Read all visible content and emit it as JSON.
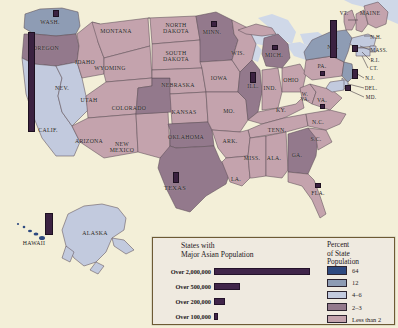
{
  "map": {
    "title": "Asian Population of the United States",
    "background_color": "#f3efd8",
    "water_color": "#cfd8e8",
    "bar_color": "#3b2241",
    "state_labels": [
      {
        "name": "WASH.",
        "text": "WASH.",
        "x": 50,
        "y": 22,
        "size": "sm"
      },
      {
        "name": "OREGON",
        "text": "OREGON",
        "x": 46,
        "y": 48,
        "size": "sm"
      },
      {
        "name": "CALIF.",
        "text": "CALIF.",
        "x": 48,
        "y": 130,
        "size": "sm"
      },
      {
        "name": "NEV.",
        "text": "NEV.",
        "x": 62,
        "y": 88,
        "size": "sm"
      },
      {
        "name": "IDAHO",
        "text": "IDAHO",
        "x": 85,
        "y": 62,
        "size": "sm"
      },
      {
        "name": "MONTANA",
        "text": "MONTANA",
        "x": 116,
        "y": 31,
        "size": "sm"
      },
      {
        "name": "WYOMING",
        "text": "WYOMING",
        "x": 110,
        "y": 68,
        "size": "sm"
      },
      {
        "name": "UTAH",
        "text": "UTAH",
        "x": 89,
        "y": 100,
        "size": "sm"
      },
      {
        "name": "ARIZONA",
        "text": "ARIZONA",
        "x": 89,
        "y": 141,
        "size": "sm"
      },
      {
        "name": "NEW-MEXICO",
        "text": "NEW\nMEXICO",
        "x": 122,
        "y": 148,
        "size": "sm"
      },
      {
        "name": "COLORADO",
        "text": "COLORADO",
        "x": 129,
        "y": 108,
        "size": "sm"
      },
      {
        "name": "NORTH-DAKOTA",
        "text": "NORTH\nDAKOTA",
        "x": 176,
        "y": 29,
        "size": "sm"
      },
      {
        "name": "SOUTH-DAKOTA",
        "text": "SOUTH\nDAKOTA",
        "x": 176,
        "y": 57,
        "size": "sm"
      },
      {
        "name": "NEBRASKA",
        "text": "NEBRASKA",
        "x": 178,
        "y": 85,
        "size": "sm"
      },
      {
        "name": "KANSAS",
        "text": "KANSAS",
        "x": 184,
        "y": 112,
        "size": "sm"
      },
      {
        "name": "OKLAHOMA",
        "text": "OKLAHOMA",
        "x": 186,
        "y": 137,
        "size": "sm"
      },
      {
        "name": "TEXAS",
        "text": "TEXAS",
        "x": 175,
        "y": 187,
        "size": "md"
      },
      {
        "name": "MINN.",
        "text": "MINN.",
        "x": 212,
        "y": 32,
        "size": "sm"
      },
      {
        "name": "IOWA",
        "text": "IOWA",
        "x": 219,
        "y": 78,
        "size": "sm"
      },
      {
        "name": "WIS.",
        "text": "WIS.",
        "x": 238,
        "y": 53,
        "size": "sm"
      },
      {
        "name": "MO.",
        "text": "MO.",
        "x": 229,
        "y": 111,
        "size": "sm"
      },
      {
        "name": "ARK.",
        "text": "ARK.",
        "x": 230,
        "y": 141,
        "size": "sm"
      },
      {
        "name": "LA.",
        "text": "LA.",
        "x": 236,
        "y": 179,
        "size": "sm"
      },
      {
        "name": "MISS.",
        "text": "MISS.",
        "x": 252,
        "y": 158,
        "size": "sm"
      },
      {
        "name": "ILL.",
        "text": "ILL.",
        "x": 253,
        "y": 86,
        "size": "sm"
      },
      {
        "name": "IND.",
        "text": "IND.",
        "x": 270,
        "y": 88,
        "size": "sm"
      },
      {
        "name": "MICH.",
        "text": "MICH.",
        "x": 274,
        "y": 55,
        "size": "sm"
      },
      {
        "name": "OHIO",
        "text": "OHIO",
        "x": 291,
        "y": 80,
        "size": "sm"
      },
      {
        "name": "KY.",
        "text": "KY.",
        "x": 281,
        "y": 110,
        "size": "sm"
      },
      {
        "name": "TENN.",
        "text": "TENN.",
        "x": 277,
        "y": 130,
        "size": "sm"
      },
      {
        "name": "ALA.",
        "text": "ALA.",
        "x": 274,
        "y": 158,
        "size": "sm"
      },
      {
        "name": "GA.",
        "text": "GA.",
        "x": 297,
        "y": 155,
        "size": "sm"
      },
      {
        "name": "FLA.",
        "text": "FLA.",
        "x": 318,
        "y": 193,
        "size": "sm"
      },
      {
        "name": "S.C.",
        "text": "S.C.",
        "x": 316,
        "y": 139,
        "size": "sm"
      },
      {
        "name": "N.C.",
        "text": "N.C.",
        "x": 318,
        "y": 122,
        "size": "sm"
      },
      {
        "name": "W.-VA.",
        "text": "W.\nVA.",
        "x": 305,
        "y": 97,
        "size": "xs"
      },
      {
        "name": "VA.",
        "text": "VA.",
        "x": 322,
        "y": 100,
        "size": "sm"
      },
      {
        "name": "PA.",
        "text": "PA.",
        "x": 322,
        "y": 66,
        "size": "sm"
      },
      {
        "name": "N.Y.",
        "text": "N.Y.",
        "x": 333,
        "y": 47,
        "size": "sm"
      },
      {
        "name": "VT.",
        "text": "VT.",
        "x": 344,
        "y": 13,
        "size": "xs"
      },
      {
        "name": "MAINE",
        "text": "MAINE",
        "x": 370,
        "y": 13,
        "size": "sm"
      },
      {
        "name": "N.H.",
        "text": "N.H.",
        "x": 376,
        "y": 37,
        "size": "xs"
      },
      {
        "name": "MASS.",
        "text": "MASS.",
        "x": 379,
        "y": 50,
        "size": "xs"
      },
      {
        "name": "R.I.",
        "text": "R.I.",
        "x": 375,
        "y": 60,
        "size": "xs"
      },
      {
        "name": "CT.",
        "text": "CT.",
        "x": 374,
        "y": 68,
        "size": "xs"
      },
      {
        "name": "N.J.",
        "text": "N.J.",
        "x": 370,
        "y": 78,
        "size": "xs"
      },
      {
        "name": "DEL.",
        "text": "DEL.",
        "x": 371,
        "y": 88,
        "size": "xs"
      },
      {
        "name": "MD.",
        "text": "MD.",
        "x": 371,
        "y": 97,
        "size": "xs"
      },
      {
        "name": "ALASKA",
        "text": "ALASKA",
        "x": 95,
        "y": 233,
        "size": "sm"
      },
      {
        "name": "HAWAII",
        "text": "HAWAII",
        "x": 34,
        "y": 243,
        "size": "sm"
      }
    ],
    "population_bars": [
      {
        "name": "bar-california",
        "state": "CALIF.",
        "x": 28,
        "y": 32,
        "w": 7,
        "h": 100,
        "tier": "Over 2,000,000"
      },
      {
        "name": "bar-new-york",
        "state": "N.Y.",
        "x": 330,
        "y": 20,
        "w": 7,
        "h": 38,
        "tier": "Over 500,000"
      },
      {
        "name": "bar-washington",
        "state": "WASH.",
        "x": 53,
        "y": 10,
        "w": 6,
        "h": 7,
        "tier": "Over 100,000"
      },
      {
        "name": "bar-minnesota",
        "state": "MINN.",
        "x": 211,
        "y": 21,
        "w": 6,
        "h": 6,
        "tier": "Over 100,000"
      },
      {
        "name": "bar-illinois",
        "state": "ILL.",
        "x": 250,
        "y": 72,
        "w": 6,
        "h": 11,
        "tier": "Over 200,000"
      },
      {
        "name": "bar-michigan",
        "state": "MICH.",
        "x": 272,
        "y": 45,
        "w": 6,
        "h": 5,
        "tier": "Over 100,000"
      },
      {
        "name": "bar-texas",
        "state": "TEXAS",
        "x": 173,
        "y": 172,
        "w": 6,
        "h": 11,
        "tier": "Over 200,000"
      },
      {
        "name": "bar-florida",
        "state": "FLA.",
        "x": 315,
        "y": 183,
        "w": 6,
        "h": 5,
        "tier": "Over 100,000"
      },
      {
        "name": "bar-new-jersey",
        "state": "N.J.",
        "x": 352,
        "y": 69,
        "w": 6,
        "h": 10,
        "tier": "Over 200,000"
      },
      {
        "name": "bar-massachu",
        "state": "MASS.",
        "x": 352,
        "y": 45,
        "w": 6,
        "h": 7,
        "tier": "Over 100,000"
      },
      {
        "name": "bar-maryland",
        "state": "MD.",
        "x": 345,
        "y": 85,
        "w": 6,
        "h": 6,
        "tier": "Over 100,000"
      },
      {
        "name": "bar-pennsylvania",
        "state": "PA.",
        "x": 320,
        "y": 71,
        "w": 5,
        "h": 5,
        "tier": "Over 100,000"
      },
      {
        "name": "bar-virginia",
        "state": "VA.",
        "x": 320,
        "y": 104,
        "w": 5,
        "h": 5,
        "tier": "Over 100,000"
      },
      {
        "name": "bar-hawaii",
        "state": "HAWAII",
        "x": 45,
        "y": 213,
        "w": 8,
        "h": 22,
        "tier": "Over 500,000"
      }
    ]
  },
  "legend": {
    "bar_legend": {
      "title_line1": "States with",
      "title_line2": "Major Asian Population",
      "rows": [
        {
          "label": "Over 2,000,000",
          "width": 96
        },
        {
          "label": "Over 500,000",
          "width": 26
        },
        {
          "label": "Over 200,000",
          "width": 11
        },
        {
          "label": "Over 100,000",
          "width": 4
        }
      ]
    },
    "percent_legend": {
      "title_line1": "Percent",
      "title_line2": "of State",
      "title_line3": "Population",
      "items": [
        {
          "label": "64",
          "color": "#2e4a80"
        },
        {
          "label": "12",
          "color": "#8e9cb4"
        },
        {
          "label": "4–6",
          "color": "#c2cade"
        },
        {
          "label": "2–3",
          "color": "#93798c"
        },
        {
          "label": "Less than 2",
          "color": "#c4a3ad"
        }
      ]
    }
  }
}
